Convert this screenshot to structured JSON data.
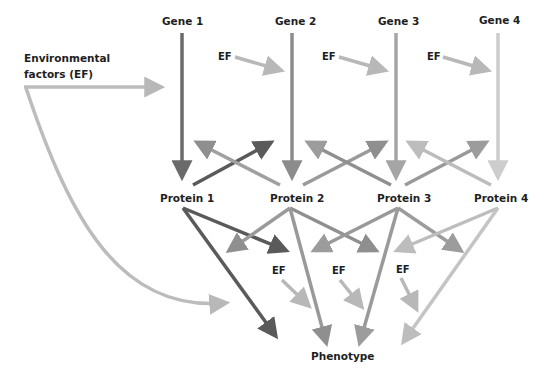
{
  "diagram": {
    "genes": [
      {
        "label": "Gene 1",
        "color": "#6a6a6a"
      },
      {
        "label": "Gene 2",
        "color": "#8c8c8c"
      },
      {
        "label": "Gene 3",
        "color": "#a5a5a5"
      },
      {
        "label": "Gene 4",
        "color": "#cdcdcd"
      }
    ],
    "proteins": [
      {
        "label": "Protein 1",
        "color": "#5a5a5a"
      },
      {
        "label": "Protein 2",
        "color": "#8f8f8f"
      },
      {
        "label": "Protein 3",
        "color": "#9c9c9c"
      },
      {
        "label": "Protein 4",
        "color": "#bdbdbd"
      }
    ],
    "environmental_factors_label_line1": "Environmental",
    "environmental_factors_label_line2": "factors (EF)",
    "ef_label": "EF",
    "ef_upper": [
      "EF",
      "EF",
      "EF"
    ],
    "ef_lower": [
      "EF",
      "EF",
      "EF"
    ],
    "phenotype_label": "Phenotype",
    "ef_arrow_color": "#b8b8b8"
  }
}
